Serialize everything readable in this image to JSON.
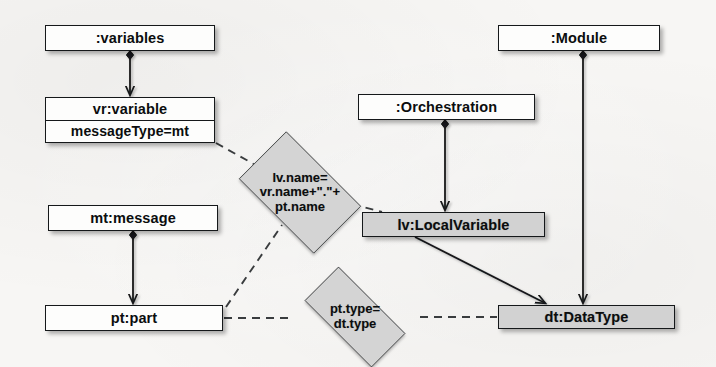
{
  "diagram": {
    "background_color": "#f7f6f4",
    "line_color": "#15181a",
    "white_fill": "#fdfdfc",
    "grey_fill": "#d2d2d2"
  },
  "nodes": [
    {
      "id": "variables",
      "label": ":variables",
      "fill": "white",
      "x": 45,
      "y": 25,
      "w": 170,
      "h": 26
    },
    {
      "id": "vr_variable",
      "label": "vr:variable",
      "attribute": "messageType=mt",
      "fill": "white",
      "x": 45,
      "y": 97,
      "w": 170,
      "h": 46
    },
    {
      "id": "mt_message",
      "label": "mt:message",
      "fill": "white",
      "x": 48,
      "y": 205,
      "w": 170,
      "h": 26
    },
    {
      "id": "pt_part",
      "label": "pt:part",
      "fill": "white",
      "x": 45,
      "y": 305,
      "w": 178,
      "h": 26
    },
    {
      "id": "orchestration",
      "label": ":Orchestration",
      "fill": "white",
      "x": 358,
      "y": 94,
      "w": 177,
      "h": 26
    },
    {
      "id": "module",
      "label": ":Module",
      "fill": "white",
      "x": 498,
      "y": 25,
      "w": 162,
      "h": 26
    },
    {
      "id": "lv_localvariable",
      "label": "lv:LocalVariable",
      "fill": "grey",
      "x": 362,
      "y": 212,
      "w": 183,
      "h": 25
    },
    {
      "id": "dt_datatype",
      "label": "dt:DataType",
      "fill": "grey",
      "x": 498,
      "y": 305,
      "w": 177,
      "h": 24
    }
  ],
  "constraints": [
    {
      "id": "name_constraint",
      "lines": [
        "lv.name=",
        "vr.name+\".\"+",
        "pt.name"
      ],
      "x": 225,
      "y": 145,
      "w": 150,
      "h": 95
    },
    {
      "id": "type_constraint",
      "lines": [
        "pt.type=",
        "dt.type"
      ],
      "x": 288,
      "y": 283,
      "w": 134,
      "h": 68
    }
  ],
  "edges": [
    {
      "id": "variables-to-vr",
      "kind": "composition",
      "from": "variables",
      "to": "vr_variable"
    },
    {
      "id": "mt-to-pt",
      "kind": "composition",
      "from": "mt_message",
      "to": "pt_part"
    },
    {
      "id": "orchestration-to-lv",
      "kind": "composition",
      "from": "orchestration",
      "to": "lv_localvariable"
    },
    {
      "id": "module-to-dt",
      "kind": "composition",
      "from": "module",
      "to": "dt_datatype"
    },
    {
      "id": "lv-to-dt",
      "kind": "association",
      "from": "lv_localvariable",
      "to": "dt_datatype"
    },
    {
      "id": "vr-to-name-constraint",
      "kind": "dashed",
      "from": "vr_variable",
      "to": "name_constraint"
    },
    {
      "id": "pt-to-name-constraint",
      "kind": "dashed",
      "from": "pt_part",
      "to": "name_constraint"
    },
    {
      "id": "name-constraint-to-lv",
      "kind": "dashed",
      "from": "name_constraint",
      "to": "lv_localvariable"
    },
    {
      "id": "pt-to-type-constraint",
      "kind": "dashed",
      "from": "pt_part",
      "to": "type_constraint"
    },
    {
      "id": "type-constraint-to-dt",
      "kind": "dashed",
      "from": "type_constraint",
      "to": "dt_datatype"
    }
  ]
}
